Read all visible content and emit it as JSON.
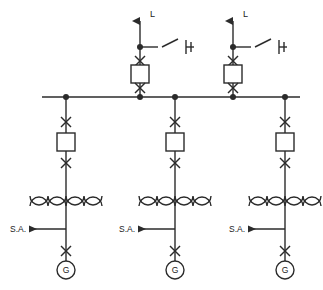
{
  "diagram": {
    "type": "electrical-single-line-diagram",
    "colors": {
      "line": "#2b2b2b",
      "background": "#ffffff",
      "text": "#1a1a1a"
    },
    "bus": {
      "name": "main-busbar",
      "y": 97,
      "x_start": 42,
      "x_end": 300,
      "node_x": [
        66,
        140,
        175,
        233,
        285
      ]
    },
    "feeders": [
      {
        "id": "feeder-1",
        "x": 140,
        "label": "L",
        "label_x": 150,
        "label_y": 17,
        "arrow_top_y": 14,
        "tap_node_y": 47,
        "switch_upper_y": 61,
        "breaker_y": 74,
        "switch_lower_y": 88,
        "disconnect": {
          "stub_end_x": 158,
          "blade_end_x": 178,
          "blade_end_y": 39,
          "terminal_x": 186,
          "hatch_x": 191
        }
      },
      {
        "id": "feeder-2",
        "x": 233,
        "label": "L",
        "label_x": 243,
        "label_y": 17,
        "arrow_top_y": 14,
        "tap_node_y": 47,
        "switch_upper_y": 61,
        "breaker_y": 74,
        "switch_lower_y": 88,
        "disconnect": {
          "stub_end_x": 251,
          "blade_end_x": 271,
          "blade_end_y": 39,
          "terminal_x": 279,
          "hatch_x": 284
        }
      }
    ],
    "generator_branches": [
      {
        "id": "generator-branch-1",
        "x": 66,
        "switch_upper_y": 122,
        "breaker_y": 142,
        "switch_lower_y": 163,
        "transformer_y": 203,
        "sa_line_y": 229,
        "sa_label": "S.A.",
        "sa_label_x": 10,
        "sa_arrow_x": 29,
        "sa_line_x_end": 66,
        "gen_switch_y": 251,
        "gen_circle_cy": 270,
        "gen_label": "G"
      },
      {
        "id": "generator-branch-2",
        "x": 175,
        "switch_upper_y": 122,
        "breaker_y": 142,
        "switch_lower_y": 163,
        "transformer_y": 203,
        "sa_line_y": 229,
        "sa_label": "S.A.",
        "sa_label_x": 119,
        "sa_arrow_x": 138,
        "sa_line_x_end": 175,
        "gen_switch_y": 251,
        "gen_circle_cy": 270,
        "gen_label": "G"
      },
      {
        "id": "generator-branch-3",
        "x": 285,
        "switch_upper_y": 122,
        "breaker_y": 142,
        "switch_lower_y": 163,
        "transformer_y": 203,
        "sa_line_y": 229,
        "sa_label": "S.A.",
        "sa_label_x": 229,
        "sa_arrow_x": 248,
        "sa_line_x_end": 285,
        "gen_switch_y": 251,
        "gen_circle_cy": 270,
        "gen_label": "G"
      }
    ],
    "symbols": {
      "disconnect_switch": "X",
      "circuit_breaker": "square-box",
      "transformer": "two-winding-coils",
      "generator": "circle-with-G",
      "node": "filled-dot"
    },
    "geometry": {
      "breaker_w": 18,
      "breaker_h": 18,
      "switch_half": 5,
      "node_r": 3,
      "gen_r": 9,
      "transformer_half_width": 36,
      "transformer_arc_count": 4,
      "transformer_arc_r": 9,
      "stroke_width": 1.4
    }
  }
}
